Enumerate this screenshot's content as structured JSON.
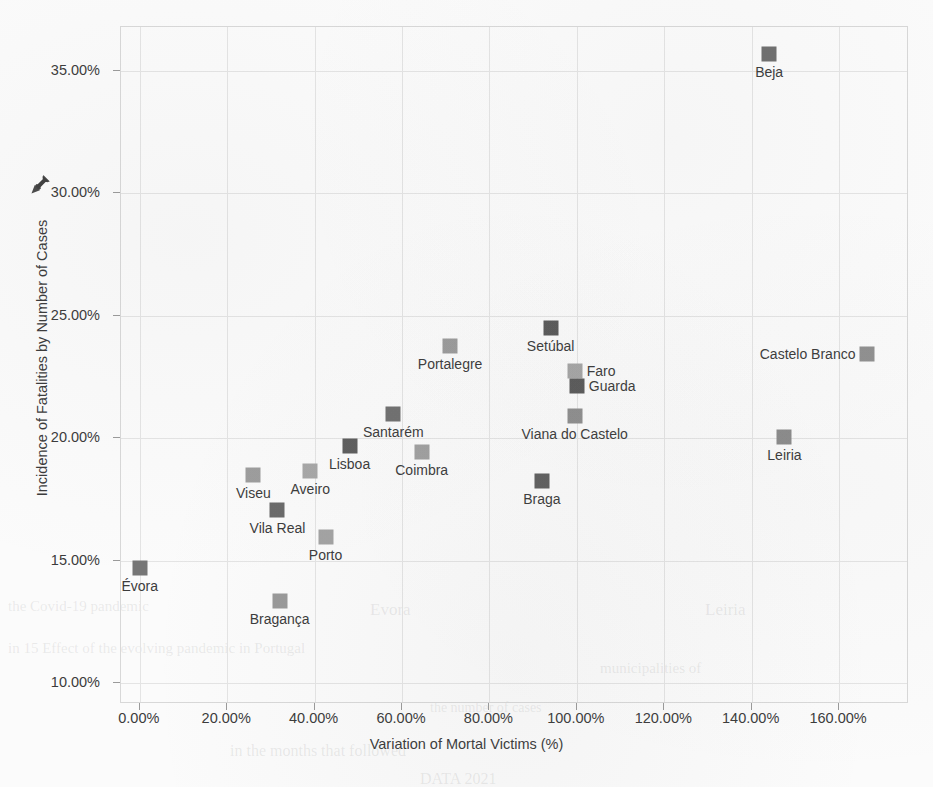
{
  "figure": {
    "ylabel": "Incidence of Fatalities by Number of Cases",
    "xlabel": "Variation of Mortal Victims (%)",
    "pin_icon": "pushpin-icon"
  },
  "ghost_text": [
    {
      "text": "Evora",
      "x": 370,
      "y": 600,
      "size": 17
    },
    {
      "text": "Leiria",
      "x": 705,
      "y": 600,
      "size": 17
    },
    {
      "text": "the Covid-19 pandemic",
      "x": 8,
      "y": 598,
      "size": 15
    },
    {
      "text": "in 15 Effect of the evolving pandemic in Portugal",
      "x": 8,
      "y": 640,
      "size": 15
    },
    {
      "text": "in the months that followed",
      "x": 230,
      "y": 742,
      "size": 16
    },
    {
      "text": "DATA 2021",
      "x": 420,
      "y": 770,
      "size": 16
    },
    {
      "text": "municipalities of",
      "x": 600,
      "y": 660,
      "size": 15
    },
    {
      "text": "the number of cases",
      "x": 430,
      "y": 700,
      "size": 14
    }
  ],
  "chart_data": {
    "type": "scatter",
    "title": "",
    "xlabel": "Variation of Mortal Victims (%)",
    "ylabel": "Incidence of Fatalities by Number of Cases",
    "xlim": [
      -4.3,
      176.0
    ],
    "ylim": [
      9.14,
      36.8
    ],
    "xticks": [
      0,
      20,
      40,
      60,
      80,
      100,
      120,
      140,
      160
    ],
    "xtick_labels": [
      "0.00%",
      "20.00%",
      "40.00%",
      "60.00%",
      "80.00%",
      "100.00%",
      "120.00%",
      "140.00%",
      "160.00%"
    ],
    "yticks": [
      10,
      15,
      20,
      25,
      30,
      35
    ],
    "ytick_labels": [
      "10.00%",
      "15.00%",
      "20.00%",
      "25.00%",
      "30.00%",
      "35.00%"
    ],
    "grid": true,
    "legend": false,
    "points": [
      {
        "label": "Beja",
        "x": 144.0,
        "y": 35.7,
        "color": "#6f6f6f",
        "label_pos": "below"
      },
      {
        "label": "Setúbal",
        "x": 94.0,
        "y": 24.5,
        "color": "#595959",
        "label_pos": "below"
      },
      {
        "label": "Portalegre",
        "x": 71.0,
        "y": 23.75,
        "color": "#9b9b9b",
        "label_pos": "below"
      },
      {
        "label": "Castelo Branco",
        "x": 166.5,
        "y": 23.45,
        "color": "#909090",
        "label_pos": "left"
      },
      {
        "label": "Faro",
        "x": 99.5,
        "y": 22.75,
        "color": "#a5a5a5",
        "label_pos": "right"
      },
      {
        "label": "Guarda",
        "x": 100.0,
        "y": 22.15,
        "color": "#5a5a5a",
        "label_pos": "right"
      },
      {
        "label": "Santarém",
        "x": 58.0,
        "y": 21.0,
        "color": "#707070",
        "label_pos": "below"
      },
      {
        "label": "Viana do Castelo",
        "x": 99.5,
        "y": 20.9,
        "color": "#8e8e8e",
        "label_pos": "below"
      },
      {
        "label": "Leiria",
        "x": 147.5,
        "y": 20.05,
        "color": "#8b8b8b",
        "label_pos": "below"
      },
      {
        "label": "Lisboa",
        "x": 48.0,
        "y": 19.7,
        "color": "#5d5d5d",
        "label_pos": "below"
      },
      {
        "label": "Coimbra",
        "x": 64.5,
        "y": 19.45,
        "color": "#a0a0a0",
        "label_pos": "below"
      },
      {
        "label": "Aveiro",
        "x": 39.0,
        "y": 18.65,
        "color": "#a7a7a7",
        "label_pos": "below"
      },
      {
        "label": "Viseu",
        "x": 26.0,
        "y": 18.5,
        "color": "#9d9d9d",
        "label_pos": "below"
      },
      {
        "label": "Braga",
        "x": 92.0,
        "y": 18.25,
        "color": "#5f5f5f",
        "label_pos": "below"
      },
      {
        "label": "Vila Real",
        "x": 31.5,
        "y": 17.05,
        "color": "#6a6a6a",
        "label_pos": "below"
      },
      {
        "label": "Porto",
        "x": 42.5,
        "y": 15.95,
        "color": "#a3a3a3",
        "label_pos": "below"
      },
      {
        "label": "Évora",
        "x": 0.0,
        "y": 14.7,
        "color": "#767676",
        "label_pos": "below"
      },
      {
        "label": "Bragança",
        "x": 32.0,
        "y": 13.35,
        "color": "#999999",
        "label_pos": "below"
      }
    ]
  }
}
